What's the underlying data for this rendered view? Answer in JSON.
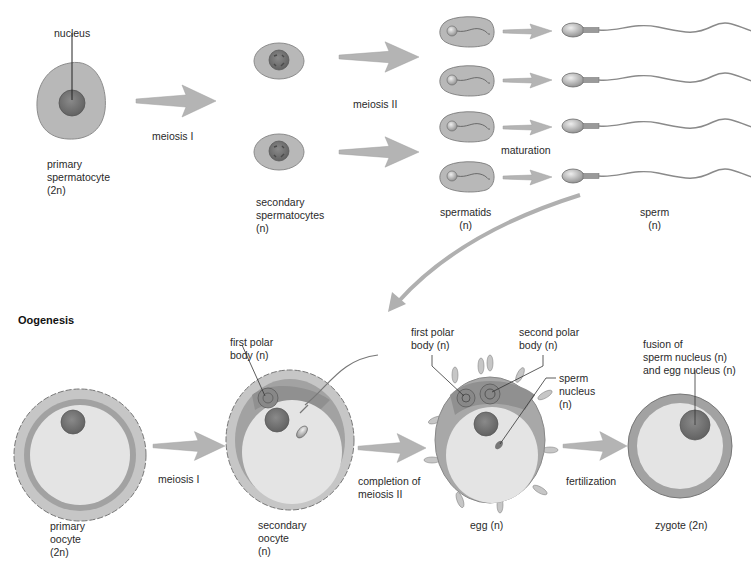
{
  "spermatogenesis": {
    "nucleus_label": "nucleus",
    "primary": "primary\nspermatocyte\n(2n)",
    "meiosis1": "meiosis I",
    "secondary": "secondary\nspermatocytes\n(n)",
    "meiosis2": "meiosis II",
    "maturation": "maturation",
    "spermatids": "spermatids\n(n)",
    "sperm": "sperm\n(n)"
  },
  "oogenesis": {
    "title": "Oogenesis",
    "primary": "primary\noocyte\n(2n)",
    "meiosis1": "meiosis I",
    "first_polar_a": "first polar\nbody (n)",
    "secondary": "secondary\noocyte\n(n)",
    "completion": "completion of\nmeiosis II",
    "first_polar_b": "first polar\nbody (n)",
    "second_polar": "second polar\nbody (n)",
    "sperm_nucleus": "sperm\nnucleus\n(n)",
    "egg": "egg (n)",
    "fertilization": "fertilization",
    "fusion": "fusion of\nsperm nucleus (n)\nand egg nucleus (n)",
    "zygote": "zygote (2n)"
  },
  "colors": {
    "cytoplasm": "#b8b8b8",
    "nucleus": "#7a7a7a",
    "egg_inner": "#e4e4e4",
    "zona": "#9e9e9e",
    "arrow": "#b4b4b4"
  }
}
